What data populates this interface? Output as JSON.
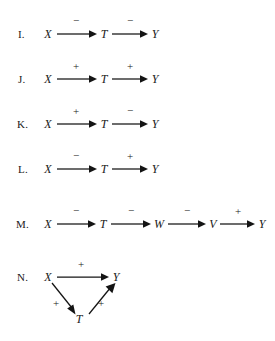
{
  "figure": {
    "background_color": "#ffffff",
    "ink_color": "#141414",
    "rows": [
      {
        "label": "I.",
        "layout": "linear",
        "nodes": [
          "X",
          "T",
          "Y"
        ],
        "signs": [
          "−",
          "−"
        ]
      },
      {
        "label": "J.",
        "layout": "linear",
        "nodes": [
          "X",
          "T",
          "Y"
        ],
        "signs": [
          "+",
          "+"
        ]
      },
      {
        "label": "K.",
        "layout": "linear",
        "nodes": [
          "X",
          "T",
          "Y"
        ],
        "signs": [
          "+",
          "−"
        ]
      },
      {
        "label": "L.",
        "layout": "linear",
        "nodes": [
          "X",
          "T",
          "Y"
        ],
        "signs": [
          "−",
          "+"
        ]
      },
      {
        "label": "M.",
        "layout": "linear",
        "nodes": [
          "X",
          "T",
          "W",
          "V",
          "Y"
        ],
        "signs": [
          "−",
          "−",
          "−",
          "+"
        ]
      },
      {
        "label": "N.",
        "layout": "triangle",
        "nodes": [
          "X",
          "Y",
          "T"
        ],
        "signs": [
          "+",
          "+",
          "+"
        ]
      }
    ]
  }
}
